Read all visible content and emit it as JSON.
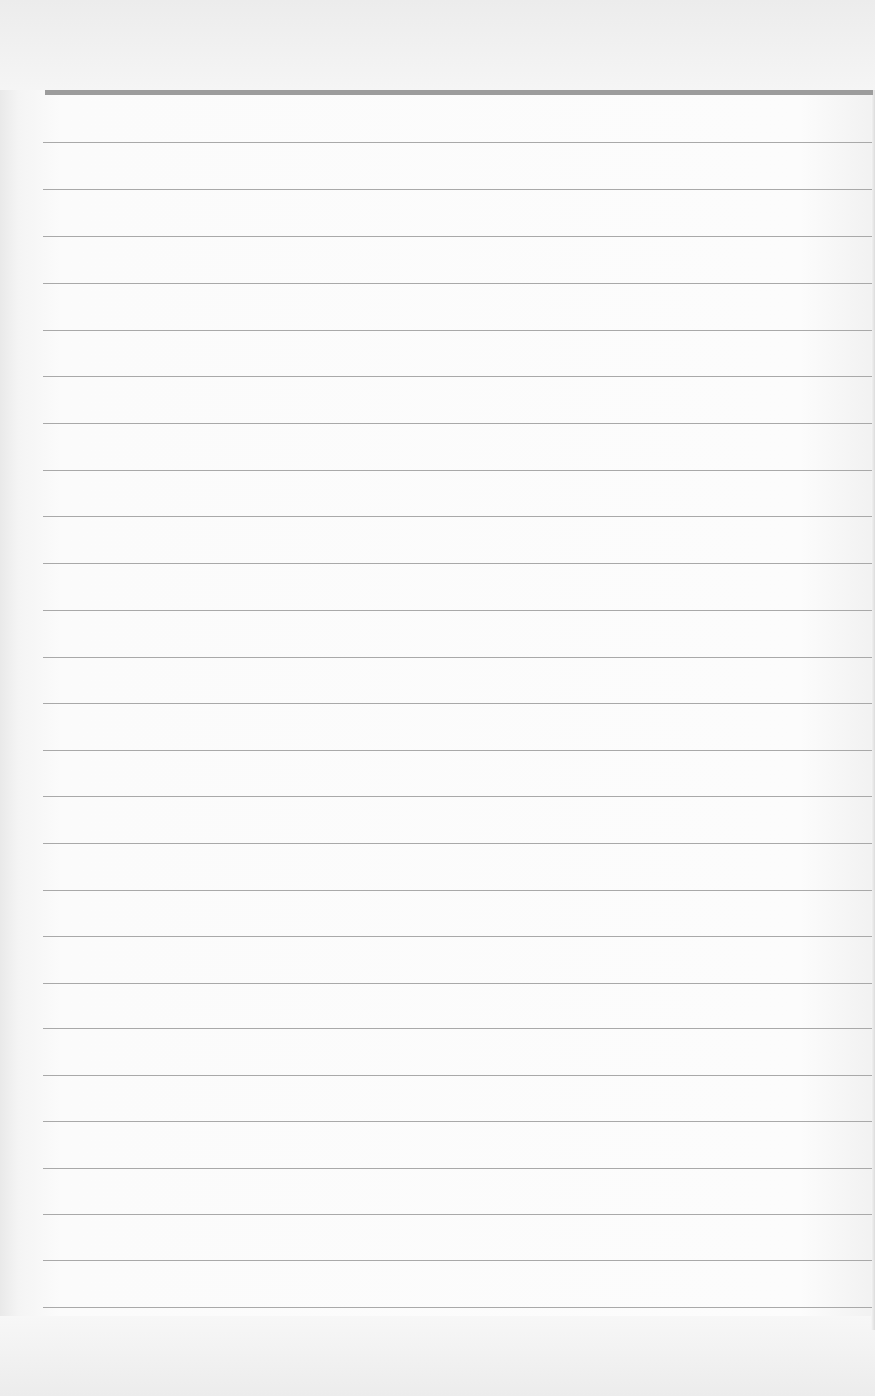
{
  "page": {
    "type": "blank lined paper",
    "background_color": "#fbfbfb",
    "rule_color": "#a9a9a9",
    "header_rule_color": "#9c9c9c"
  },
  "header_rule": {
    "y": 92,
    "x_start": 45,
    "x_end": 873,
    "thickness": 5
  },
  "rules": {
    "x_start": 43,
    "x_end": 872,
    "y_positions": [
      142,
      189,
      236,
      283,
      330,
      376,
      423,
      470,
      516,
      563,
      610,
      657,
      703,
      750,
      796,
      843,
      890,
      936,
      983,
      1028,
      1075,
      1121,
      1168,
      1214,
      1260,
      1307
    ]
  }
}
